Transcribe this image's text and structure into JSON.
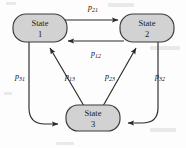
{
  "diagram": {
    "type": "state-transition-graph",
    "background_color": "#fdfdfd",
    "node_fill": "#d2d2d2",
    "node_stroke": "#3a3a3a",
    "edge_color": "#2b2b2b",
    "nodes": [
      {
        "id": "state1",
        "line1": "State",
        "line2": "1",
        "cx": 40,
        "cy": 28,
        "rx": 27,
        "ry": 14
      },
      {
        "id": "state2",
        "line1": "State",
        "line2": "2",
        "cx": 147,
        "cy": 28,
        "rx": 27,
        "ry": 14
      },
      {
        "id": "state3",
        "line1": "State",
        "line2": "3",
        "cx": 93,
        "cy": 118,
        "rx": 27,
        "ry": 13
      }
    ],
    "edges": [
      {
        "id": "e21",
        "label_base": "p",
        "label_sub": "21",
        "from": "state1",
        "to": "state2",
        "label_x": 93,
        "label_y": 10
      },
      {
        "id": "e12",
        "label_base": "p",
        "label_sub": "12",
        "from": "state2",
        "to": "state1",
        "label_x": 96,
        "label_y": 56
      },
      {
        "id": "e31",
        "label_base": "p",
        "label_sub": "31",
        "from": "state1",
        "to": "state3",
        "label_x": 20,
        "label_y": 79
      },
      {
        "id": "e13",
        "label_base": "p",
        "label_sub": "13",
        "from": "state3",
        "to": "state1",
        "label_x": 70,
        "label_y": 79
      },
      {
        "id": "e23",
        "label_base": "p",
        "label_sub": "23",
        "from": "state3",
        "to": "state2",
        "label_x": 110,
        "label_y": 79
      },
      {
        "id": "e32",
        "label_base": "p",
        "label_sub": "32",
        "from": "state2",
        "to": "state3",
        "label_x": 160,
        "label_y": 79
      }
    ]
  }
}
